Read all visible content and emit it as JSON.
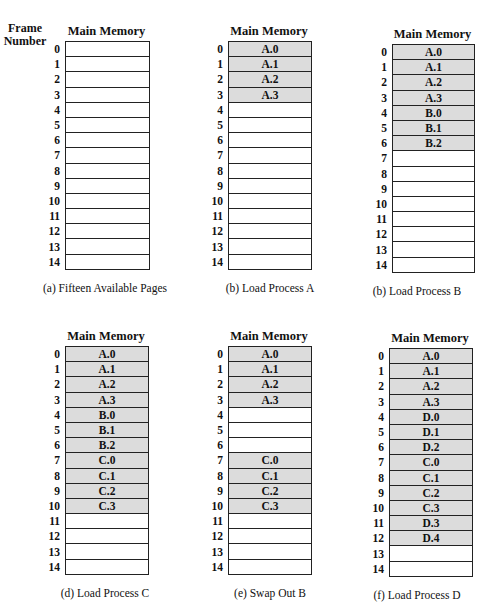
{
  "frame_header": [
    "Frame",
    "Number"
  ],
  "column_title": "Main Memory",
  "used_color": "#dcdcdc",
  "frame_numbers": [
    "0",
    "1",
    "2",
    "3",
    "4",
    "5",
    "6",
    "7",
    "8",
    "9",
    "10",
    "11",
    "12",
    "13",
    "14"
  ],
  "panels": [
    {
      "caption": "(a) Fifteen Available Pages",
      "frames": [
        "",
        "",
        "",
        "",
        "",
        "",
        "",
        "",
        "",
        "",
        "",
        "",
        "",
        "",
        ""
      ]
    },
    {
      "caption": "(b) Load Process A",
      "frames": [
        "A.0",
        "A.1",
        "A.2",
        "A.3",
        "",
        "",
        "",
        "",
        "",
        "",
        "",
        "",
        "",
        "",
        ""
      ]
    },
    {
      "caption": "(b) Load Process B",
      "frames": [
        "A.0",
        "A.1",
        "A.2",
        "A.3",
        "B.0",
        "B.1",
        "B.2",
        "",
        "",
        "",
        "",
        "",
        "",
        "",
        ""
      ]
    },
    {
      "caption": "(d) Load Process C",
      "frames": [
        "A.0",
        "A.1",
        "A.2",
        "A.3",
        "B.0",
        "B.1",
        "B.2",
        "C.0",
        "C.1",
        "C.2",
        "C.3",
        "",
        "",
        "",
        ""
      ]
    },
    {
      "caption": "(e) Swap Out B",
      "frames": [
        "A.0",
        "A.1",
        "A.2",
        "A.3",
        "",
        "",
        "",
        "C.0",
        "C.1",
        "C.2",
        "C.3",
        "",
        "",
        "",
        ""
      ]
    },
    {
      "caption": "(f) Load Process D",
      "frames": [
        "A.0",
        "A.1",
        "A.2",
        "A.3",
        "D.0",
        "D.1",
        "D.2",
        "C.0",
        "C.1",
        "C.2",
        "C.3",
        "D.3",
        "D.4",
        "",
        ""
      ]
    }
  ]
}
